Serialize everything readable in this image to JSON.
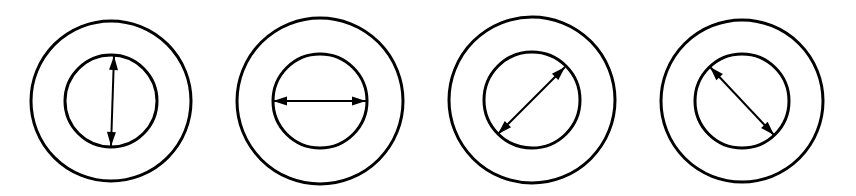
{
  "diagram": {
    "stroke_color": "#000000",
    "background_color": "#ffffff",
    "figures": [
      {
        "id": "figure-1",
        "orientation": "vertical",
        "center": [
          111,
          101
        ],
        "outer_radius": 80,
        "inner_radius": 46,
        "arrow": {
          "from": [
            114,
            56
          ],
          "to": [
            111,
            146
          ]
        }
      },
      {
        "id": "figure-2",
        "orientation": "horizontal",
        "center": [
          320,
          101
        ],
        "outer_radius": 83,
        "inner_radius": 47,
        "arrow": {
          "from": [
            273,
            101
          ],
          "to": [
            366,
            101
          ]
        }
      },
      {
        "id": "figure-3",
        "orientation": "diagonal-up-right",
        "center": [
          532,
          100
        ],
        "outer_radius": 83,
        "inner_radius": 48,
        "arrow": {
          "from": [
            498,
            134
          ],
          "to": [
            565,
            67
          ]
        }
      },
      {
        "id": "figure-4",
        "orientation": "diagonal-down-right",
        "center": [
          742,
          101
        ],
        "outer_radius": 81,
        "inner_radius": 47,
        "arrow": {
          "from": [
            710,
            67
          ],
          "to": [
            774,
            135
          ]
        }
      }
    ]
  }
}
